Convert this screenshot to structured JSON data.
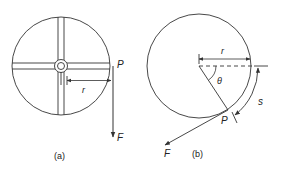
{
  "figure": {
    "panel_a": {
      "caption": "(a)",
      "point_label": "P",
      "radius_label": "r",
      "force_label": "F"
    },
    "panel_b": {
      "caption": "(b)",
      "point_label": "P",
      "radius_label": "r",
      "angle_label": "θ",
      "arc_label": "s",
      "force_label": "F"
    },
    "colors": {
      "stroke": "#333333",
      "background": "#ffffff"
    }
  }
}
